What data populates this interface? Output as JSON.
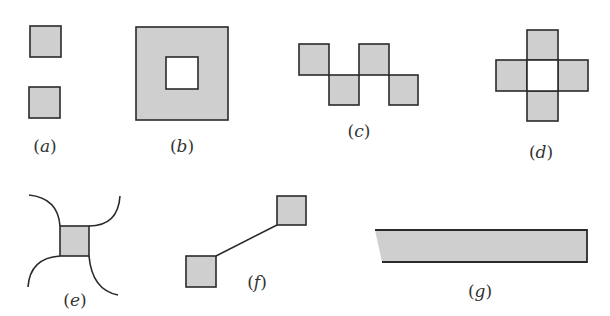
{
  "colors": {
    "fill": "#cfcfcf",
    "stroke": "#2a2a2a",
    "background": "#ffffff",
    "label": "#333333"
  },
  "figures": [
    {
      "id": "a",
      "label": "(a)",
      "letter": "a",
      "description": "two separate squares, one above the other"
    },
    {
      "id": "b",
      "label": "(b)",
      "letter": "b",
      "description": "large square with a square hole in the center"
    },
    {
      "id": "c",
      "label": "(c)",
      "letter": "c",
      "description": "four squares touching corner to corner in a zigzag"
    },
    {
      "id": "d",
      "label": "(d)",
      "letter": "d",
      "description": "four squares around an empty center forming a cross"
    },
    {
      "id": "e",
      "label": "(e)",
      "letter": "e",
      "description": "square with four curved arcs extending from its corners"
    },
    {
      "id": "f",
      "label": "(f)",
      "letter": "f",
      "description": "two squares connected by a straight line"
    },
    {
      "id": "g",
      "label": "(g)",
      "letter": "g",
      "description": "long strip with open left end"
    }
  ]
}
